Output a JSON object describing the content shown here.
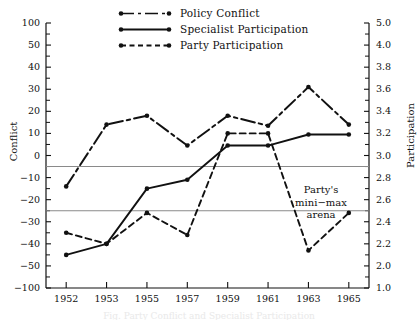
{
  "chart_data": {
    "type": "line",
    "title": "",
    "categories": [
      "1952",
      "1953",
      "1955",
      "1957",
      "1959",
      "1961",
      "1963",
      "1965"
    ],
    "xlabel": "",
    "ylabel": "Conflict",
    "ylabel_secondary": "Participation",
    "ylim": [
      -100,
      100
    ],
    "ylim_secondary": [
      1.0,
      5.0
    ],
    "grid": false,
    "legend_position": "top-center",
    "y_tick_labels_left": [
      "100",
      "50",
      "40",
      "30",
      "20",
      "10",
      "0",
      "-10",
      "-20",
      "-30",
      "-40",
      "-50",
      "-100"
    ],
    "y_tick_values_left": [
      100,
      50,
      40,
      30,
      20,
      10,
      0,
      -10,
      -20,
      -30,
      -40,
      -50,
      -100
    ],
    "y_tick_labels_right": [
      "5.0",
      "4.0",
      "3.8",
      "3.6",
      "3.4",
      "3.2",
      "3.0",
      "2.8",
      "2.6",
      "2.4",
      "2.2",
      "2.0",
      "1.0"
    ],
    "y_tick_values_right": [
      5.0,
      4.0,
      3.8,
      3.6,
      3.4,
      3.2,
      3.0,
      2.8,
      2.6,
      2.4,
      2.2,
      2.0,
      1.0
    ],
    "series": [
      {
        "name": "Policy Conflict",
        "axis": "left",
        "style": "dash-dot",
        "values": [
          -14,
          14,
          18,
          4.5,
          18,
          13.5,
          31,
          14
        ]
      },
      {
        "name": "Specialist Participation",
        "axis": "left",
        "style": "solid",
        "values": [
          -45,
          -40,
          -15,
          -11,
          4.5,
          4.5,
          9.5,
          9.5
        ],
        "values_right_axis": [
          2.1,
          2.2,
          2.7,
          2.78,
          3.09,
          3.09,
          3.19,
          3.19
        ]
      },
      {
        "name": "Party Participation",
        "axis": "left",
        "style": "dashed",
        "values": [
          -35,
          -40,
          -26,
          -36,
          10,
          10,
          -43,
          -26
        ],
        "values_right_axis": [
          2.3,
          2.2,
          2.5,
          2.3,
          3.2,
          3.2,
          2.15,
          2.5
        ]
      }
    ],
    "reference_lines": [
      {
        "name": "arena-upper",
        "value_left": -5,
        "value_right": 2.9
      },
      {
        "name": "arena-lower",
        "value_left": -25,
        "value_right": 2.5
      }
    ],
    "annotations": [
      {
        "name": "arena-note",
        "lines": [
          "Party's",
          "mini−max",
          "arena"
        ]
      }
    ]
  },
  "legend": {
    "items": [
      {
        "label": "Policy  Conflict",
        "style": "dash-dot"
      },
      {
        "label": "Specialist  Participation",
        "style": "solid"
      },
      {
        "label": "Party  Participation",
        "style": "dashed"
      }
    ]
  },
  "annotation": {
    "line1": "Party's",
    "line2": "mini−max",
    "line3": "arena"
  },
  "caption": {
    "sliver": "Fig. Party Conflict and Specialist Participation"
  },
  "colors": {
    "ink": "#111111",
    "reference_line": "#8a8a8a",
    "background": "#ffffff"
  }
}
